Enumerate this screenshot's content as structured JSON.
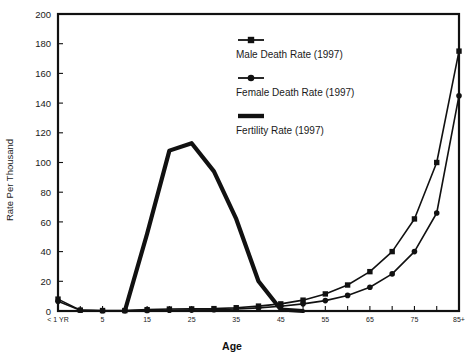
{
  "chart_data": {
    "type": "line",
    "title": "",
    "xlabel": "Age",
    "ylabel": "Rate Per Thousand",
    "ylim": [
      0,
      200
    ],
    "ytick_step": 20,
    "yticks": [
      0,
      20,
      40,
      60,
      80,
      100,
      120,
      140,
      160,
      180,
      200
    ],
    "grid": false,
    "legend_position": "inside-top-center",
    "x": [
      0,
      1,
      5,
      10,
      15,
      20,
      25,
      30,
      35,
      40,
      45,
      50,
      55,
      60,
      65,
      70,
      75,
      80,
      85
    ],
    "categories": [
      "< 1 YR",
      "1",
      "5",
      "10",
      "15",
      "20",
      "25",
      "30",
      "35",
      "40",
      "45",
      "50",
      "55",
      "60",
      "65",
      "70",
      "75",
      "80",
      "85+"
    ],
    "xtick_labels": [
      "< 1 YR",
      "",
      "5",
      "",
      "15",
      "",
      "25",
      "",
      "35",
      "",
      "45",
      "",
      "55",
      "",
      "65",
      "",
      "75",
      "",
      "85+"
    ],
    "series": [
      {
        "name": "Male Death Rate (1997)",
        "marker": "square",
        "line_width": "thin",
        "values": [
          8.0,
          0.6,
          0.3,
          0.3,
          0.9,
          1.3,
          1.4,
          1.6,
          2.2,
          3.3,
          4.8,
          7.3,
          11.5,
          17.5,
          26.5,
          40.0,
          62.0,
          100.0,
          175.0
        ]
      },
      {
        "name": "Female Death Rate (1997)",
        "marker": "circle",
        "line_width": "thin",
        "values": [
          6.5,
          0.5,
          0.2,
          0.2,
          0.4,
          0.5,
          0.6,
          0.8,
          1.3,
          2.1,
          3.2,
          4.8,
          7.0,
          10.5,
          16.0,
          25.0,
          40.0,
          66.0,
          145.0
        ]
      },
      {
        "name": "Fertility Rate (1997)",
        "marker": "none",
        "line_width": "thick",
        "values": [
          0,
          0,
          0,
          0,
          52.0,
          108.0,
          113.0,
          94.0,
          62.0,
          20.0,
          1.0,
          0,
          0,
          0,
          0,
          0,
          0,
          0,
          0
        ]
      }
    ],
    "legend": [
      {
        "label": "Male Death Rate (1997)",
        "marker": "square"
      },
      {
        "label": "Female Death Rate (1997)",
        "marker": "circle"
      },
      {
        "label": "Fertility Rate (1997)",
        "marker": "thick-line"
      }
    ],
    "colors": {
      "ink": "#111111",
      "background": "#ffffff"
    }
  }
}
